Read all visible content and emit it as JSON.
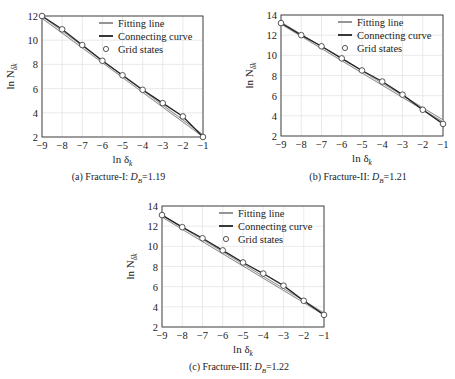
{
  "chart_data": [
    {
      "id": "a",
      "type": "line",
      "caption": "(a) Fracture-I: D_B=1.19",
      "caption_prefix": "(a) Fracture-I: ",
      "caption_D": "D",
      "caption_sub": "B",
      "caption_value": "=1.19",
      "xlabel": "ln δ_k",
      "ylabel": "ln N_δk",
      "xlim": [
        -9,
        -1
      ],
      "ylim": [
        2,
        12
      ],
      "xticks": [
        -9,
        -8,
        -7,
        -6,
        -5,
        -4,
        -3,
        -2,
        -1
      ],
      "yticks": [
        2,
        4,
        6,
        8,
        10,
        12
      ],
      "grid": true,
      "legend_position": "upper right",
      "x": [
        -9,
        -8,
        -7,
        -6,
        -5,
        -4,
        -3,
        -2,
        -1
      ],
      "series": [
        {
          "name": "Fitting line",
          "type": "line",
          "color": "#8a8a8a",
          "x": [
            -9,
            -1
          ],
          "values": [
            11.9,
            2.1
          ]
        },
        {
          "name": "Connecting curve",
          "type": "line",
          "color": "#222222",
          "values": [
            12.0,
            10.9,
            9.6,
            8.3,
            7.1,
            5.9,
            4.8,
            3.7,
            2.0
          ]
        },
        {
          "name": "Grid states",
          "type": "scatter",
          "marker": "circle-open",
          "values": [
            12.0,
            10.9,
            9.6,
            8.3,
            7.1,
            5.9,
            4.8,
            3.7,
            2.0
          ]
        }
      ]
    },
    {
      "id": "b",
      "type": "line",
      "caption": "(b) Fracture-II: D_B=1.21",
      "caption_prefix": "(b) Fracture-II: ",
      "caption_D": "D",
      "caption_sub": "B",
      "caption_value": "=1.21",
      "xlabel": "ln δ_k",
      "ylabel": "ln N_δk",
      "xlim": [
        -9,
        -1
      ],
      "ylim": [
        2,
        14
      ],
      "xticks": [
        -9,
        -8,
        -7,
        -6,
        -5,
        -4,
        -3,
        -2,
        -1
      ],
      "yticks": [
        2,
        4,
        6,
        8,
        10,
        12,
        14
      ],
      "grid": true,
      "legend_position": "upper right",
      "x": [
        -9,
        -8,
        -7,
        -6,
        -5,
        -4,
        -3,
        -2,
        -1
      ],
      "series": [
        {
          "name": "Fitting line",
          "type": "line",
          "color": "#8a8a8a",
          "x": [
            -9,
            -1
          ],
          "values": [
            13.2,
            3.5
          ]
        },
        {
          "name": "Connecting curve",
          "type": "line",
          "color": "#222222",
          "values": [
            13.2,
            12.0,
            10.9,
            9.7,
            8.5,
            7.4,
            6.1,
            4.6,
            3.2
          ]
        },
        {
          "name": "Grid states",
          "type": "scatter",
          "marker": "circle-open",
          "values": [
            13.2,
            12.0,
            10.9,
            9.7,
            8.5,
            7.4,
            6.1,
            4.6,
            3.2
          ]
        }
      ]
    },
    {
      "id": "c",
      "type": "line",
      "caption": "(c) Fracture-III: D_B=1.22",
      "caption_prefix": "(c) Fracture-III: ",
      "caption_D": "D",
      "caption_sub": "B",
      "caption_value": "=1.22",
      "xlabel": "ln δ_k",
      "ylabel": "ln N_δk",
      "xlim": [
        -9,
        -1
      ],
      "ylim": [
        2,
        14
      ],
      "xticks": [
        -9,
        -8,
        -7,
        -6,
        -5,
        -4,
        -3,
        -2,
        -1
      ],
      "yticks": [
        2,
        4,
        6,
        8,
        10,
        12,
        14
      ],
      "grid": true,
      "legend_position": "upper right",
      "x": [
        -9,
        -8,
        -7,
        -6,
        -5,
        -4,
        -3,
        -2,
        -1
      ],
      "series": [
        {
          "name": "Fitting line",
          "type": "line",
          "color": "#8a8a8a",
          "x": [
            -9,
            -1
          ],
          "values": [
            13.0,
            3.3
          ]
        },
        {
          "name": "Connecting curve",
          "type": "line",
          "color": "#222222",
          "values": [
            13.1,
            11.9,
            10.8,
            9.6,
            8.4,
            7.3,
            6.1,
            4.6,
            3.2
          ]
        },
        {
          "name": "Grid states",
          "type": "scatter",
          "marker": "circle-open",
          "values": [
            13.1,
            11.9,
            10.8,
            9.6,
            8.4,
            7.3,
            6.1,
            4.6,
            3.2
          ]
        }
      ]
    }
  ],
  "legend": {
    "fitting_line": "Fitting line",
    "connecting_curve": "Connecting curve",
    "grid_states": "Grid states"
  },
  "axis_text": {
    "x_main": "ln δ",
    "x_sub": "k",
    "y_main": "ln N",
    "y_sub": "δk"
  }
}
